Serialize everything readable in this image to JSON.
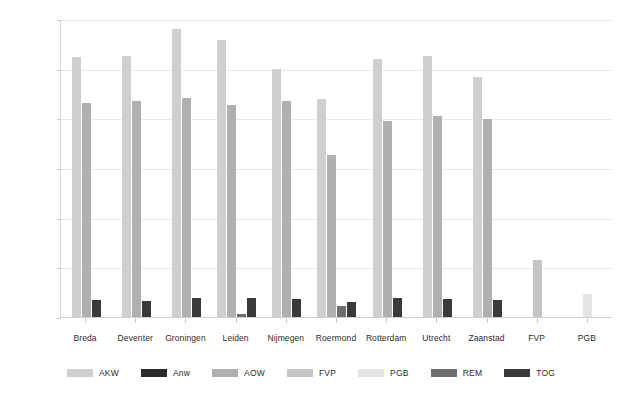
{
  "chart_data": {
    "type": "bar",
    "title": "",
    "subtitle": "",
    "xlabel": "",
    "ylabel": "",
    "ylim": [
      0,
      300000
    ],
    "ytick_step": 50000,
    "ytick_labels": [
      "300000",
      "250000",
      "200000",
      "150000",
      "100000",
      "50000",
      "0"
    ],
    "ytick_values": [
      300000,
      250000,
      200000,
      150000,
      100000,
      50000,
      0
    ],
    "grid": true,
    "legend_position": "bottom",
    "categories": [
      "Breda",
      "Deventer",
      "Groningen",
      "Leiden",
      "Nijmegen",
      "Roermond",
      "Rotterdam",
      "Utrecht",
      "Zaanstad",
      "FVP",
      "PGB"
    ],
    "series": [
      {
        "name": "AKW",
        "color": "#cfcfcf",
        "values": [
          262000,
          262500,
          290000,
          279000,
          250000,
          219000,
          260000,
          262500,
          242000,
          null,
          null
        ]
      },
      {
        "name": "Anw",
        "color": "#2b2b2b",
        "values": [
          null,
          null,
          null,
          null,
          null,
          null,
          null,
          null,
          null,
          null,
          null
        ]
      },
      {
        "name": "AOW",
        "color": "#b0b0b0",
        "values": [
          215000,
          217000,
          220000,
          213500,
          217000,
          163000,
          197000,
          202500,
          199000,
          null,
          null
        ]
      },
      {
        "name": "FVP",
        "color": "#c4c4c4",
        "values": [
          null,
          null,
          null,
          null,
          null,
          null,
          null,
          null,
          null,
          57000,
          null
        ]
      },
      {
        "name": "PGB",
        "color": "#e4e4e4",
        "values": [
          null,
          null,
          null,
          null,
          null,
          null,
          null,
          null,
          null,
          null,
          23000
        ]
      },
      {
        "name": "REM",
        "color": "#6e6e6e",
        "values": [
          null,
          null,
          null,
          3500,
          null,
          11000,
          null,
          null,
          null,
          null,
          null
        ]
      },
      {
        "name": "TOG",
        "color": "#3a3a3a",
        "values": [
          17500,
          16500,
          19000,
          19500,
          18500,
          15000,
          19000,
          18000,
          17000,
          null,
          null
        ]
      }
    ]
  },
  "legend": {
    "items": [
      {
        "label": "AKW",
        "color": "#cfcfcf"
      },
      {
        "label": "Anw",
        "color": "#2b2b2b"
      },
      {
        "label": "AOW",
        "color": "#b0b0b0"
      },
      {
        "label": "FVP",
        "color": "#c4c4c4"
      },
      {
        "label": "PGB",
        "color": "#e4e4e4"
      },
      {
        "label": "REM",
        "color": "#6e6e6e"
      },
      {
        "label": "TOG",
        "color": "#3a3a3a"
      }
    ]
  },
  "colors": {
    "background": "#ffffff",
    "grid": "#e9e9e9",
    "axis": "#d0d0d0",
    "text": "#2b2b2b"
  }
}
